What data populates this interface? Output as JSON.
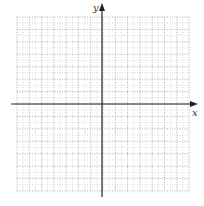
{
  "diagram": {
    "type": "coordinate-plane",
    "axes": {
      "x_label": "x",
      "y_label": "y",
      "arrows": "positive-ends"
    },
    "grid": {
      "columns": 14,
      "rows": 14,
      "columns_left_of_y_axis": 7,
      "rows_above_x_axis": 7,
      "line_style": "dotted",
      "tick_labels": "none"
    },
    "colors": {
      "axis": "#222222",
      "grid": "#9a9a9a",
      "background": "#ffffff"
    }
  }
}
